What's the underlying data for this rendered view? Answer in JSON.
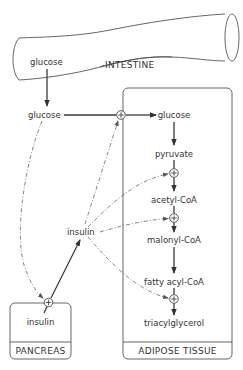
{
  "diagram": {
    "colors": {
      "line": "#3a3a3a",
      "background": "#ffffff",
      "text": "#333333"
    },
    "organs": {
      "intestine": {
        "label": "INTESTINE",
        "contents": "glucose"
      },
      "pancreas": {
        "label": "PANCREAS",
        "contents": "insulin"
      },
      "adipose": {
        "label": "ADIPOSE TISSUE"
      }
    },
    "blood": {
      "glucose": "glucose",
      "insulin": "insulin"
    },
    "pathway": [
      {
        "name": "glucose"
      },
      {
        "name": "pyruvate"
      },
      {
        "name": "acetyl-CoA"
      },
      {
        "name": "malonyl-CoA"
      },
      {
        "name": "fatty acyl-CoA"
      },
      {
        "name": "triacylglycerol"
      }
    ],
    "stimulation_symbol": "+",
    "edges": [
      {
        "from": "intestine glucose",
        "to": "blood glucose",
        "style": "solid"
      },
      {
        "from": "blood glucose",
        "to": "adipose glucose",
        "style": "solid",
        "stimulated_by": "insulin"
      },
      {
        "from": "blood glucose",
        "to": "pancreas insulin release",
        "style": "dashed",
        "type": "stimulates"
      },
      {
        "from": "pancreas insulin",
        "to": "blood insulin",
        "style": "solid"
      },
      {
        "from": "insulin",
        "to": "glucose uptake",
        "style": "dashed",
        "type": "stimulates"
      },
      {
        "from": "insulin",
        "to": "pyruvate -> acetyl-CoA",
        "style": "dashed",
        "type": "stimulates"
      },
      {
        "from": "insulin",
        "to": "acetyl-CoA -> malonyl-CoA",
        "style": "dashed",
        "type": "stimulates"
      },
      {
        "from": "insulin",
        "to": "fatty acyl-CoA -> triacylglycerol",
        "style": "dashed",
        "type": "stimulates"
      }
    ]
  }
}
